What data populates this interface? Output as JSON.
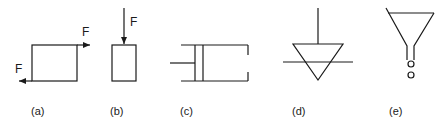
{
  "figure": {
    "panels": [
      {
        "id": "a",
        "caption": "(a)",
        "description": "Rectangle with shear forces: force arrow to the right on top edge, to the left on bottom edge",
        "force_labels": [
          "F",
          "F"
        ]
      },
      {
        "id": "b",
        "caption": "(b)",
        "description": "Rectangle with compressive force arrow pointing down onto top",
        "force_labels": [
          "F"
        ]
      },
      {
        "id": "c",
        "caption": "(c)",
        "description": "Piston-cylinder (dashpot) symbol"
      },
      {
        "id": "d",
        "caption": "(d)",
        "description": "Inverted triangle with vertical stem crossing a horizontal line (liquid level / free surface symbol)"
      },
      {
        "id": "e",
        "caption": "(e)",
        "description": "Funnel with drops falling from stem"
      }
    ]
  },
  "colors": {
    "stroke": "#1a1a1a",
    "background": "#ffffff"
  }
}
